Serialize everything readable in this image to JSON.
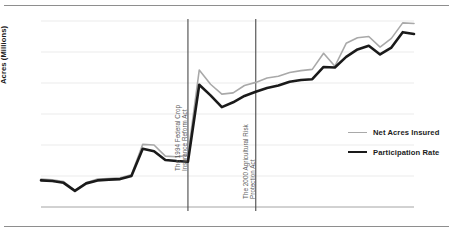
{
  "chart_data": {
    "type": "line",
    "title": "",
    "xlabel": "",
    "ylabel": "Acres (Millions)",
    "y2label": "",
    "grid": true,
    "legend_position": "inside-right",
    "x": [
      1981,
      1982,
      1983,
      1984,
      1985,
      1986,
      1987,
      1988,
      1989,
      1990,
      1991,
      1992,
      1993,
      1994,
      1995,
      1996,
      1997,
      1998,
      1999,
      2000,
      2001,
      2002,
      2003,
      2004,
      2005,
      2006,
      2007,
      2008,
      2009,
      2010,
      2011,
      2012,
      2013,
      2014
    ],
    "xticks": [
      1981,
      1985,
      1989,
      1993,
      1997,
      2001,
      2005,
      2009,
      2013
    ],
    "xtick_labels": [
      "1981",
      "1985",
      "1989",
      "1993",
      "1997",
      "2001",
      "2005",
      "2009",
      "2013"
    ],
    "yticks": [
      0,
      50,
      100,
      150,
      200,
      250,
      300
    ],
    "ytick_labels": [
      "0",
      "50",
      "100",
      "150",
      "200",
      "250",
      "300"
    ],
    "ylim": [
      0,
      300
    ],
    "y2ticks": [
      0,
      10,
      20,
      30,
      40,
      50,
      60,
      70,
      80,
      90,
      100
    ],
    "y2tick_labels": [
      "0%",
      "10%",
      "20%",
      "30%",
      "40%",
      "50%",
      "60%",
      "70%",
      "80%",
      "90%",
      "100%"
    ],
    "y2lim": [
      0,
      100
    ],
    "series": [
      {
        "name": "Net Acres Insured",
        "axis": "left",
        "color": "#a9a9a9",
        "width": 1.6,
        "values": [
          45,
          44,
          41,
          27,
          39,
          45,
          46,
          47,
          52,
          101,
          100,
          82,
          81,
          83,
          221,
          198,
          182,
          184,
          196,
          201,
          208,
          211,
          217,
          220,
          222,
          248,
          227,
          264,
          273,
          275,
          258,
          272,
          297,
          296
        ]
      },
      {
        "name": "Participation Rate",
        "axis": "right",
        "color": "#1a1a1a",
        "width": 2.6,
        "values": [
          14.3,
          14.0,
          13.0,
          8.7,
          12.7,
          14.3,
          14.7,
          15.0,
          16.7,
          31.3,
          30.0,
          25.3,
          24.7,
          24.3,
          65.7,
          60.0,
          53.7,
          56.3,
          59.7,
          62.0,
          64.0,
          65.3,
          67.3,
          68.3,
          68.7,
          75.3,
          75.0,
          80.7,
          84.7,
          86.7,
          82.0,
          85.7,
          94.0,
          93.0
        ]
      }
    ],
    "annotations": [
      {
        "name": "event-line-1994",
        "x": 1994,
        "line1": "The 1994 Federal Crop",
        "line2": "Insurance Reform Act"
      },
      {
        "name": "event-line-2000",
        "x": 2000,
        "line1": "The 2000 Agricultural Risk",
        "line2": "Protection Act"
      }
    ]
  },
  "legend": {
    "items": [
      {
        "label": "Net Acres Insured"
      },
      {
        "label": "Participation Rate"
      }
    ]
  }
}
